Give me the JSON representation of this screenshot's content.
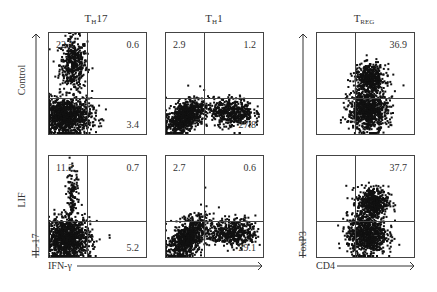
{
  "chart_data": {
    "type": "scatter",
    "subtype": "flow-cytometry-quadrant-plots",
    "columns": [
      {
        "title_main": "T",
        "title_sub": "H",
        "title_rest": "17",
        "x_marker": "IFN-γ",
        "y_marker": "IL-17"
      },
      {
        "title_main": "T",
        "title_sub": "H",
        "title_rest": "1",
        "x_marker": "IFN-γ",
        "y_marker": "IL-17"
      },
      {
        "title_main": "T",
        "title_sub": "REG",
        "title_rest": "",
        "x_marker": "CD4",
        "y_marker": "FoxP3"
      }
    ],
    "rows": [
      "Control",
      "LIF"
    ],
    "axis_labels": {
      "row_axis": [
        "Control",
        "LIF"
      ],
      "th_x": "IFN-γ",
      "th_y": "IL-17",
      "treg_x": "CD4",
      "treg_y": "FoxP3"
    },
    "panels": [
      {
        "row": "Control",
        "column": "TH17",
        "quadrants": {
          "upper_left": "22.1",
          "upper_right": "0.6",
          "lower_right": "3.4"
        },
        "clusters": [
          {
            "cx": 0.26,
            "cy": 0.68,
            "sx": 0.07,
            "sy": 0.13,
            "n": 450
          },
          {
            "cx": 0.18,
            "cy": 0.17,
            "sx": 0.13,
            "sy": 0.09,
            "n": 1100
          }
        ]
      },
      {
        "row": "Control",
        "column": "TH1",
        "quadrants": {
          "upper_left": "2.9",
          "upper_right": "1.2",
          "lower_right": "27.8"
        },
        "clusters": [
          {
            "cx": 0.2,
            "cy": 0.17,
            "sx": 0.1,
            "sy": 0.08,
            "n": 750,
            "tilt": 0.5
          },
          {
            "cx": 0.7,
            "cy": 0.21,
            "sx": 0.1,
            "sy": 0.07,
            "n": 450
          },
          {
            "cx": 0.48,
            "cy": 0.22,
            "sx": 0.08,
            "sy": 0.05,
            "n": 60
          }
        ]
      },
      {
        "row": "Control",
        "column": "TREG",
        "quadrants": {
          "upper_right": "36.9"
        },
        "clusters": [
          {
            "cx": 0.55,
            "cy": 0.54,
            "sx": 0.08,
            "sy": 0.07,
            "n": 500
          },
          {
            "cx": 0.53,
            "cy": 0.23,
            "sx": 0.1,
            "sy": 0.1,
            "n": 850
          }
        ]
      },
      {
        "row": "LIF",
        "column": "TH17",
        "quadrants": {
          "upper_left": "11.2",
          "upper_right": "0.7",
          "lower_right": "5.2"
        },
        "clusters": [
          {
            "cx": 0.25,
            "cy": 0.58,
            "sx": 0.03,
            "sy": 0.15,
            "n": 140
          },
          {
            "cx": 0.2,
            "cy": 0.18,
            "sx": 0.12,
            "sy": 0.1,
            "n": 1100
          }
        ]
      },
      {
        "row": "LIF",
        "column": "TH1",
        "quadrants": {
          "upper_left": "2.7",
          "upper_right": "0.6",
          "lower_right": "29.1"
        },
        "clusters": [
          {
            "cx": 0.22,
            "cy": 0.18,
            "sx": 0.1,
            "sy": 0.09,
            "n": 800,
            "tilt": 0.6
          },
          {
            "cx": 0.73,
            "cy": 0.24,
            "sx": 0.1,
            "sy": 0.07,
            "n": 420
          },
          {
            "cx": 0.5,
            "cy": 0.22,
            "sx": 0.08,
            "sy": 0.05,
            "n": 80
          }
        ]
      },
      {
        "row": "LIF",
        "column": "TREG",
        "quadrants": {
          "upper_right": "37.7"
        },
        "clusters": [
          {
            "cx": 0.58,
            "cy": 0.53,
            "sx": 0.08,
            "sy": 0.08,
            "n": 500
          },
          {
            "cx": 0.52,
            "cy": 0.22,
            "sx": 0.1,
            "sy": 0.1,
            "n": 850
          }
        ]
      }
    ]
  }
}
